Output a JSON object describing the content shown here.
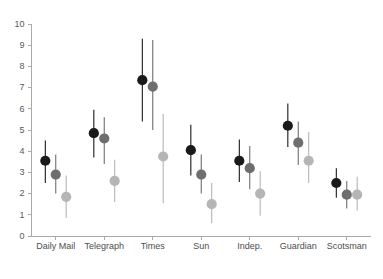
{
  "chart_data": {
    "type": "scatter",
    "title": "",
    "xlabel": "",
    "ylabel": "",
    "ylim": [
      0,
      10
    ],
    "yticks": [
      0,
      1,
      2,
      3,
      4,
      5,
      6,
      7,
      8,
      9,
      10
    ],
    "ytick_labels": [
      "0",
      "1",
      "2",
      "3",
      "4",
      "5",
      "6",
      "7",
      "8",
      "9",
      "10"
    ],
    "grid": false,
    "legend": "none",
    "error_bars": "vertical",
    "categories": [
      "Daily Mail",
      "Telegraph",
      "Times",
      "Sun",
      "Indep.",
      "Guardian",
      "Scotsman"
    ],
    "series": [
      {
        "name": "series-1",
        "color": "#1a1a1a",
        "values": [
          3.55,
          4.85,
          7.35,
          4.05,
          3.55,
          5.2,
          2.5
        ],
        "err_low": [
          2.5,
          3.7,
          5.4,
          2.85,
          2.55,
          4.2,
          1.8
        ],
        "err_high": [
          4.5,
          5.95,
          9.3,
          5.25,
          4.55,
          6.25,
          3.2
        ]
      },
      {
        "name": "series-2",
        "color": "#6e6e6e",
        "values": [
          2.9,
          4.6,
          7.05,
          2.9,
          3.2,
          4.4,
          1.95
        ],
        "err_low": [
          2.0,
          3.4,
          5.0,
          2.0,
          2.2,
          3.35,
          1.3
        ],
        "err_high": [
          3.85,
          5.6,
          9.25,
          3.85,
          4.25,
          5.4,
          2.6
        ]
      },
      {
        "name": "series-3",
        "color": "#b5b5b5",
        "values": [
          1.85,
          2.6,
          3.75,
          1.5,
          2.0,
          3.55,
          1.95
        ],
        "err_low": [
          0.85,
          1.6,
          1.55,
          0.6,
          0.95,
          2.5,
          1.2
        ],
        "err_high": [
          2.85,
          3.6,
          5.75,
          2.5,
          3.05,
          4.9,
          2.8
        ]
      }
    ]
  },
  "axes": {
    "y_axis_name": "y-axis",
    "x_axis_name": "x-axis"
  }
}
